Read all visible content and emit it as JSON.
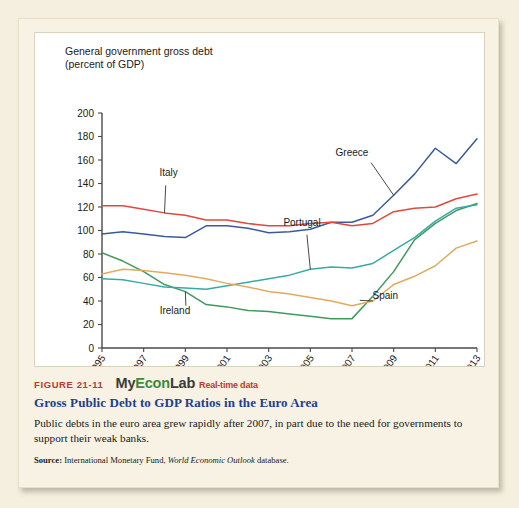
{
  "figure": {
    "number_label": "FIGURE 21-11",
    "logo": {
      "part1": "My",
      "part2": "Econ",
      "part3": "Lab",
      "badge": "Real-time data"
    },
    "title": "Gross Public Debt to GDP Ratios in the Euro Area",
    "body": "Public debts in the euro area grew rapidly after 2007, in part due to the need for governments to support their weak banks.",
    "source_label": "Source:",
    "source_pre": "International Monetary Fund,",
    "source_italic": "World Economic Outlook",
    "source_post": "database."
  },
  "colors": {
    "greece": "#3a5a9b",
    "italy": "#e0493c",
    "ireland": "#3f9a5c",
    "portugal": "#3aa9a5",
    "spain": "#e2ab5c",
    "fig_num": "#c0392b",
    "title_blue": "#1d3f8f",
    "logo_green": "#3f8a3f",
    "card_bg": "#f7f2e3",
    "plot_bg": "#ffffff"
  },
  "chart_data": {
    "type": "line",
    "title": "General government gross debt\n(percent of GDP)",
    "ylabel": "percent of GDP",
    "xlabel": "",
    "ylim": [
      0,
      200
    ],
    "ytick_values": [
      0,
      20,
      40,
      60,
      80,
      100,
      120,
      140,
      160,
      180,
      200
    ],
    "ytick_labels": [
      "0",
      "20",
      "40",
      "60",
      "80",
      "100",
      "120",
      "140",
      "160",
      "180",
      "200"
    ],
    "grid": false,
    "legend_position": "inline-annotations",
    "x": [
      1995,
      1996,
      1997,
      1998,
      1999,
      2000,
      2001,
      2002,
      2003,
      2004,
      2005,
      2006,
      2007,
      2008,
      2009,
      2010,
      2011,
      2012,
      2013
    ],
    "xtick_values": [
      1995,
      1997,
      1999,
      2001,
      2003,
      2005,
      2007,
      2009,
      2011,
      2013
    ],
    "xtick_labels": [
      "1995",
      "1997",
      "1999",
      "2001",
      "2003",
      "2005",
      "2007",
      "2009",
      "2011",
      "2013"
    ],
    "series": [
      {
        "name": "Greece",
        "color": "#3a5a9b",
        "label_x": 2007.0,
        "label_y": 163,
        "values": [
          97,
          99,
          97,
          95,
          94,
          104,
          104,
          102,
          98,
          99,
          101,
          107,
          107,
          113,
          130,
          148,
          170,
          157,
          178
        ]
      },
      {
        "name": "Italy",
        "color": "#e0493c",
        "label_x": 1998.2,
        "label_y": 146,
        "values": [
          121,
          121,
          118,
          115,
          113,
          109,
          109,
          106,
          104,
          104,
          106,
          107,
          104,
          106,
          116,
          119,
          120,
          127,
          131
        ]
      },
      {
        "name": "Ireland",
        "color": "#3f9a5c",
        "label_x": 1998.5,
        "label_y": 29,
        "values": [
          81,
          74,
          65,
          54,
          48,
          37,
          35,
          32,
          31,
          29,
          27,
          25,
          25,
          44,
          65,
          92,
          106,
          117,
          123
        ]
      },
      {
        "name": "Portugal",
        "color": "#3aa9a5",
        "label_x": 2004.6,
        "label_y": 104,
        "values": [
          59,
          58,
          55,
          52,
          51,
          50,
          53,
          56,
          59,
          62,
          67,
          69,
          68,
          72,
          83,
          94,
          108,
          119,
          122
        ]
      },
      {
        "name": "Spain",
        "color": "#e2ab5c",
        "label_x": 2008.6,
        "label_y": 42,
        "values": [
          63,
          67,
          66,
          64,
          62,
          59,
          55,
          52,
          48,
          46,
          43,
          40,
          36,
          40,
          54,
          61,
          70,
          85,
          91
        ]
      }
    ]
  }
}
